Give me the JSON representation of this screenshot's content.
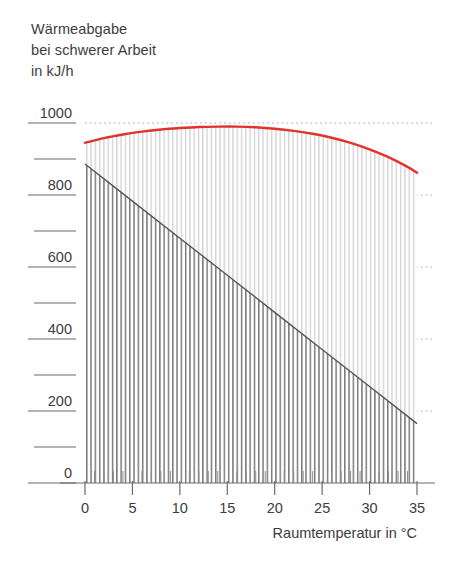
{
  "chart_data": {
    "type": "area",
    "title": "Wärmeabgabe bei schwerer Arbeit in kJ/h",
    "title_lines": [
      "Wärmeabgabe",
      "bei schwerer Arbeit",
      "in kJ/h"
    ],
    "xlabel": "Raumtemperatur in  °C",
    "ylabel": "Wärmeabgabe bei schwerer Arbeit in kJ/h",
    "xlim": [
      0,
      35
    ],
    "ylim": [
      0,
      1000
    ],
    "x_ticks": [
      0,
      5,
      10,
      15,
      20,
      25,
      30,
      35
    ],
    "x_tick_labels": [
      "0",
      "5",
      "10",
      "15",
      "20",
      "25",
      "30",
      "35"
    ],
    "x_minor_step": 1,
    "y_ticks": [
      0,
      100,
      200,
      300,
      400,
      500,
      600,
      700,
      800,
      900,
      1000
    ],
    "y_tick_labels": [
      "0",
      "",
      "200",
      "",
      "400",
      "",
      "600",
      "",
      "800",
      "",
      "1000"
    ],
    "grid": "horizontal-dotted-at-labeled-y",
    "legend": "none",
    "hatch": "vertical-lines",
    "series": [
      {
        "name": "Gesamtwärmeabgabe",
        "role": "upper-boundary",
        "color": "#e0332a",
        "style": "solid-curve",
        "x": [
          0,
          2,
          4,
          6,
          8,
          10,
          12,
          14,
          16,
          18,
          20,
          22,
          24,
          26,
          28,
          30,
          32,
          34,
          35
        ],
        "values": [
          945,
          958,
          968,
          976,
          982,
          986,
          989,
          990,
          990,
          988,
          984,
          978,
          970,
          959,
          945,
          927,
          905,
          878,
          862
        ]
      },
      {
        "name": "Trockene Wärmeabgabe",
        "role": "lower-boundary",
        "color": "#555555",
        "style": "solid-line",
        "x": [
          0,
          5,
          10,
          15,
          20,
          25,
          30,
          35
        ],
        "values": [
          886,
          783,
          680,
          577,
          474,
          371,
          268,
          165
        ]
      }
    ],
    "areas": [
      {
        "name": "feuchte-waermeabgabe",
        "between": [
          "Trockene Wärmeabgabe",
          "Gesamtwärmeabgabe"
        ],
        "fill": "light-vertical-hatch",
        "color": "#c9c9c9"
      },
      {
        "name": "trockene-waermeabgabe",
        "between": [
          "baseline-0",
          "Trockene Wärmeabgabe"
        ],
        "fill": "dark-vertical-hatch",
        "color": "#6e6e6e"
      }
    ],
    "colors": {
      "accent_red": "#e0332a",
      "line_gray": "#555555",
      "axis": "#6b6b6b",
      "grid": "#9a9a9a",
      "text": "#3d3d3d",
      "hatch_dark": "#6e6e6e",
      "hatch_light": "#cfcfcf"
    }
  }
}
